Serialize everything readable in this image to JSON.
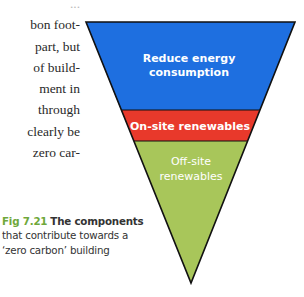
{
  "body_text": {
    "lines": [
      "bon foot-",
      "part, but",
      "of build-",
      "ment  in",
      "through",
      "clearly be",
      "zero car-"
    ],
    "partial_top_line": "..."
  },
  "diagram": {
    "type": "inverted-triangle-funnel",
    "layers": [
      {
        "id": "reduce",
        "label_line1": "Reduce energy",
        "label_line2": "consumption",
        "color": "#1e6fe0"
      },
      {
        "id": "onsite",
        "label_line1": "On-site renewables",
        "color": "#e8392b"
      },
      {
        "id": "offsite",
        "label_line1": "Off-site",
        "label_line2": "renewables",
        "color": "#a8c65a"
      }
    ],
    "outline_color": "#111111"
  },
  "caption": {
    "fig_number": "Fig 7.21",
    "line1": "The components",
    "line2": "that contribute towards a",
    "line3": "‘zero carbon’ building"
  }
}
